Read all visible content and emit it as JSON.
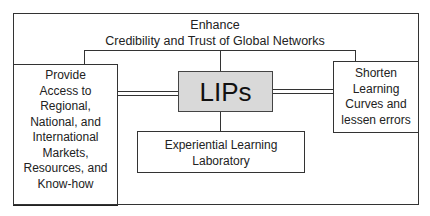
{
  "diagram": {
    "top_label": {
      "line1": "Enhance",
      "line2": "Credibility and Trust of Global Networks"
    },
    "center_node": {
      "label": "LIPs",
      "fill_color": "#d9d9d9"
    },
    "left_node": {
      "lines": [
        "Provide",
        "Access to",
        "Regional,",
        "National, and",
        "International",
        "Markets,",
        "Resources, and",
        "Know-how"
      ]
    },
    "right_node": {
      "lines": [
        "Shorten",
        "Learning",
        "Curves and",
        "lessen errors"
      ]
    },
    "bottom_node": {
      "line1": "Experiential Learning",
      "line2": "Laboratory"
    },
    "connections": [
      {
        "from": "LIPs",
        "to": "Enhance Credibility and Trust of Global Networks",
        "style": "single"
      },
      {
        "from": "LIPs",
        "to": "Provide Access to Regional, National, and International Markets, Resources, and Know-how",
        "style": "double"
      },
      {
        "from": "LIPs",
        "to": "Shorten Learning Curves and lessen errors",
        "style": "double"
      },
      {
        "from": "LIPs",
        "to": "Experiential Learning Laboratory",
        "style": "single"
      }
    ]
  }
}
